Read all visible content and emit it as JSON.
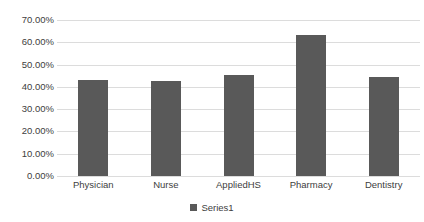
{
  "chart_data": {
    "type": "bar",
    "title": "",
    "title_visible": false,
    "title_note": "title row is cropped off the top edge of the screenshot and is illegible",
    "xlabel": "",
    "ylabel": "",
    "categories": [
      "Physician",
      "Nurse",
      "AppliedHS",
      "Pharmacy",
      "Dentistry"
    ],
    "series": [
      {
        "name": "Series1",
        "values": [
          43.0,
          42.5,
          45.5,
          63.5,
          44.5
        ]
      }
    ],
    "ylim": [
      0,
      70
    ],
    "ytick_step": 10,
    "ytick_labels": [
      "70.00%",
      "60.00%",
      "50.00%",
      "40.00%",
      "30.00%",
      "20.00%",
      "10.00%",
      "0.00%"
    ],
    "value_format": "percent",
    "grid": true,
    "grid_axis": "y",
    "legend": true,
    "legend_position": "bottom",
    "legend_entries": [
      "Series1"
    ],
    "colors": {
      "bar": "#595959",
      "grid": "#dcdcdc",
      "text": "#404040",
      "background": "#ffffff"
    }
  }
}
